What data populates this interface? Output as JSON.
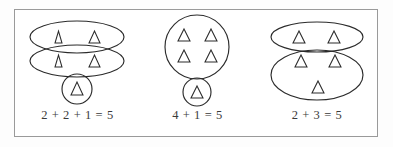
{
  "figure": {
    "title_visible": false,
    "border_color": "#9a9a9a",
    "background_color": "#ffffff",
    "stroke_color": "#2b2b2b",
    "text_color": "#3a3a3a"
  },
  "groups": [
    {
      "id": "group-1",
      "caption": "2 + 2 + 1 = 5",
      "addends": [
        2,
        2,
        1
      ],
      "sum": 5,
      "total_triangles": 5,
      "containers": [
        {
          "shape": "ellipse",
          "triangles": 2
        },
        {
          "shape": "ellipse",
          "triangles": 2
        },
        {
          "shape": "circle",
          "triangles": 1
        }
      ]
    },
    {
      "id": "group-2",
      "caption": "4 + 1 = 5",
      "addends": [
        4,
        1
      ],
      "sum": 5,
      "total_triangles": 5,
      "containers": [
        {
          "shape": "circle",
          "triangles": 4
        },
        {
          "shape": "circle",
          "triangles": 1
        }
      ]
    },
    {
      "id": "group-3",
      "caption": "2 + 3 = 5",
      "addends": [
        2,
        3
      ],
      "sum": 5,
      "total_triangles": 5,
      "containers": [
        {
          "shape": "ellipse",
          "triangles": 2
        },
        {
          "shape": "ellipse",
          "triangles": 3
        }
      ]
    }
  ],
  "icons": {
    "triangle": "triangle-outline-up"
  }
}
